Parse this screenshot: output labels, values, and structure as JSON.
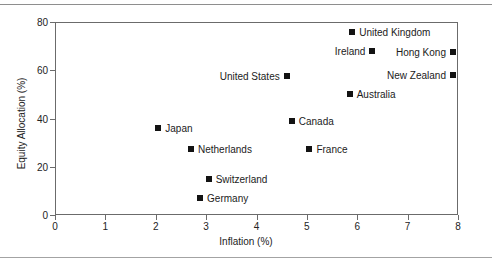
{
  "figure": {
    "background_color": "#ffffff",
    "frame_color": "#6b6b6b",
    "marker_color": "#131313"
  },
  "chart_data": {
    "type": "scatter",
    "title": "",
    "xlabel": "Inflation (%)",
    "ylabel": "Equity Allocation (%)",
    "xlim": [
      0,
      8
    ],
    "ylim": [
      0,
      80
    ],
    "xticks": [
      0,
      1,
      2,
      3,
      4,
      5,
      6,
      7,
      8
    ],
    "yticks": [
      0,
      20,
      40,
      60,
      80
    ],
    "xtick_labels": [
      "0",
      "1",
      "2",
      "3",
      "4",
      "5",
      "6",
      "7",
      "8"
    ],
    "ytick_labels": [
      "0",
      "20",
      "40",
      "60",
      "80"
    ],
    "grid": false,
    "legend": "none",
    "points": [
      {
        "label": "United Kingdom",
        "x": 5.9,
        "y": 76.0,
        "label_side": "right"
      },
      {
        "label": "Ireland",
        "x": 6.3,
        "y": 68.0,
        "label_side": "left"
      },
      {
        "label": "Hong Kong",
        "x": 7.9,
        "y": 67.5,
        "label_side": "left"
      },
      {
        "label": "New Zealand",
        "x": 7.9,
        "y": 58.0,
        "label_side": "left"
      },
      {
        "label": "United States",
        "x": 4.6,
        "y": 57.5,
        "label_side": "left"
      },
      {
        "label": "Australia",
        "x": 5.85,
        "y": 50.0,
        "label_side": "right"
      },
      {
        "label": "Canada",
        "x": 4.7,
        "y": 39.0,
        "label_side": "right"
      },
      {
        "label": "Japan",
        "x": 2.05,
        "y": 36.0,
        "label_side": "right"
      },
      {
        "label": "Netherlands",
        "x": 2.7,
        "y": 27.5,
        "label_side": "right"
      },
      {
        "label": "France",
        "x": 5.05,
        "y": 27.5,
        "label_side": "right"
      },
      {
        "label": "Switzerland",
        "x": 3.05,
        "y": 15.0,
        "label_side": "right"
      },
      {
        "label": "Germany",
        "x": 2.88,
        "y": 7.0,
        "label_side": "right"
      }
    ]
  }
}
